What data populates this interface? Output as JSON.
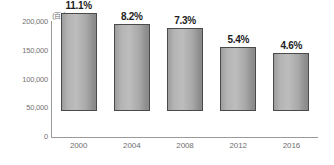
{
  "chart_data": {
    "type": "bar",
    "title": "",
    "xlabel": "",
    "ylabel": "",
    "unit_label": "(百人)",
    "categories": [
      "2000",
      "2004",
      "2008",
      "2012",
      "2016"
    ],
    "values": [
      170000,
      152000,
      144000,
      112000,
      100000
    ],
    "data_labels": [
      "11.1%",
      "8.2%",
      "7.3%",
      "5.4%",
      "4.6%"
    ],
    "ylim": [
      0,
      200000
    ],
    "ytick_values": [
      200000,
      150000,
      100000,
      50000,
      0
    ],
    "ytick_labels": [
      "200,000",
      "150,000",
      "100,000",
      "50,000",
      "0"
    ],
    "grid": false,
    "legend": null,
    "colors": {
      "bar_fill_light": "#bdbdbd",
      "bar_fill_dark": "#8a8a8a",
      "bar_border": "#4a4a4a",
      "axis": "#9a9a9a",
      "tick_text": "#737373",
      "label_text": "#1d1d1d",
      "background": "#ffffff"
    }
  }
}
